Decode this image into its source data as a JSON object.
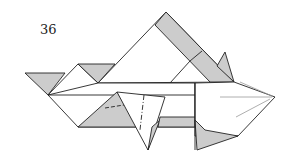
{
  "diagram": {
    "step_number": "36",
    "colors": {
      "paper_white": "#ffffff",
      "paper_colored": "#cccccc",
      "line": "#222222",
      "crease": "#888888"
    }
  }
}
